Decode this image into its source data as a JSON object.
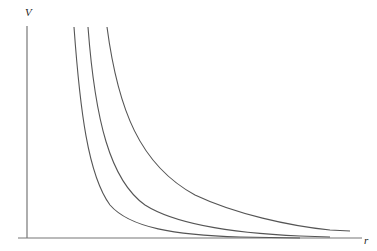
{
  "diagram": {
    "type": "curve-family",
    "axes": {
      "y_label": "V",
      "x_label": "r"
    },
    "curves": [
      {
        "name": "curve-1",
        "description": "innermost hyperbola-like decay"
      },
      {
        "name": "curve-2",
        "description": "middle hyperbola-like decay"
      },
      {
        "name": "curve-3",
        "description": "outermost hyperbola-like decay"
      }
    ],
    "colors": {
      "line": "#555555",
      "axis": "#777777",
      "background": "#ffffff"
    }
  }
}
